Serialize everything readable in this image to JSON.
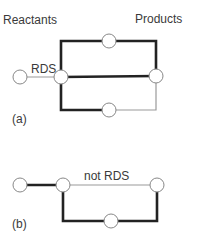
{
  "diagram_a": {
    "reactants_label": "Reactants",
    "products_label": "Products",
    "rds_label": "RDS",
    "panel_label": "(a)"
  },
  "diagram_b": {
    "not_rds_label": "not RDS",
    "panel_label": "(b)"
  },
  "colors": {
    "line_thick": "#222222",
    "line_thin": "#9a9a9a",
    "node_stroke": "#888888",
    "node_fill": "#ffffff",
    "text": "#3a3a3a"
  }
}
